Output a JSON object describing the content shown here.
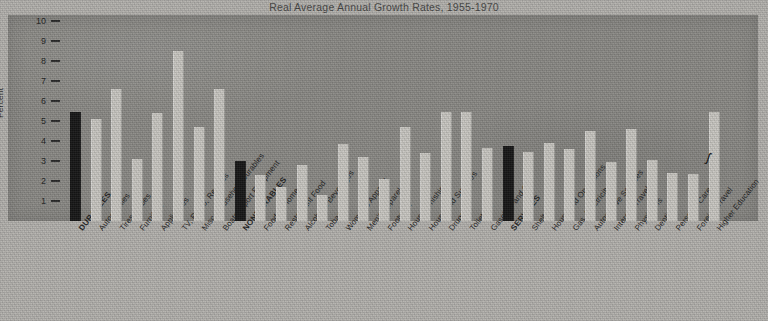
{
  "chart": {
    "title": "Real Average Annual Growth Rates, 1955-1970",
    "ylabel": "Percent"
  },
  "chart_data": {
    "type": "bar",
    "title": "Real Average Annual Growth Rates, 1955-1970",
    "xlabel": "",
    "ylabel": "Percent",
    "ylim": [
      0,
      10
    ],
    "yticks": [
      1,
      2,
      3,
      4,
      5,
      6,
      7,
      8,
      9,
      10
    ],
    "grid": false,
    "legend": null,
    "series_colors": {
      "group_total": "#171717",
      "category": "#c9c7c2"
    },
    "categories": [
      "DURABLES",
      "Automobiles",
      "Tires, Tubes",
      "Furniture",
      "Appliances",
      "TV, Radio, Records",
      "Misc. Household Durables",
      "Boats, Sport Equipment",
      "NONDURABLES",
      "Food at Home",
      "Restaurant Food",
      "Alcoholic Beverages",
      "Tobacco",
      "Women's Apparel",
      "Men's Apparel",
      "Footwear",
      "Housefurnishings",
      "Household Supplies",
      "Drugs",
      "Toiletries",
      "Gasoline and Oil",
      "SERVICES",
      "Shelter",
      "Household Operations",
      "Gas, Electricity",
      "Automotive Services",
      "Intercity Travel",
      "Physicians",
      "Dentists",
      "Personal Care",
      "Foreign Travel",
      "Higher Education"
    ],
    "values": [
      5.45,
      5.1,
      6.6,
      3.1,
      5.4,
      8.5,
      4.7,
      6.6,
      3.0,
      2.3,
      1.7,
      2.8,
      1.3,
      3.85,
      3.2,
      2.1,
      4.7,
      3.4,
      5.45,
      5.45,
      3.65,
      3.75,
      3.45,
      3.9,
      3.6,
      4.5,
      2.95,
      4.6,
      3.05,
      2.4,
      2.35,
      5.45
    ],
    "highlighted": [
      "DURABLES",
      "NONDURABLES",
      "SERVICES"
    ]
  }
}
